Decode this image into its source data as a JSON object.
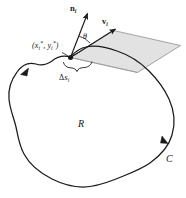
{
  "figure": {
    "background_color": "#ffffff",
    "stroke_color": "#1a1a1a",
    "parallelogram_fill": "#e2e2e2",
    "parallelogram_stroke": "#8a8a8a",
    "labels": {
      "normal_vector": "n",
      "normal_vector_subscript": "i",
      "velocity_vector": "v",
      "velocity_vector_subscript": "i",
      "theta": "θ",
      "point_open": "(",
      "point_x": "x",
      "point_x_sub": "i",
      "point_x_sup": "*",
      "point_comma": ", ",
      "point_y": "y",
      "point_y_sub": "i",
      "point_y_sup": "*",
      "point_close": ")",
      "arc_delta": "Δ",
      "arc_s": "s",
      "arc_sub": "i",
      "region": "R",
      "curve": "C"
    },
    "geometry": {
      "base_point": [
        70,
        57
      ],
      "normal_tip": [
        88,
        12
      ],
      "velocity_tip": [
        117,
        28
      ],
      "angle_degrees": 33,
      "arrow_on_curve_left": [
        25,
        70
      ],
      "arrow_on_curve_right": [
        165,
        142
      ]
    }
  }
}
